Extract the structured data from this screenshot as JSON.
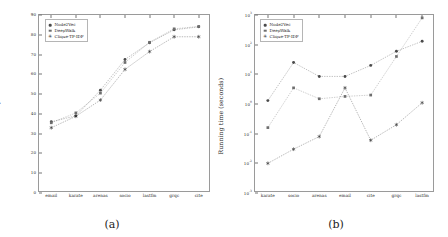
{
  "figure": {
    "panels": [
      {
        "caption": "(a)",
        "ylabel": "Modularity",
        "xlabel": "",
        "legend_position": "top-left"
      },
      {
        "caption": "(b)",
        "ylabel": "Running time (seconds)",
        "xlabel": "",
        "legend_position": "top-left"
      }
    ]
  },
  "legend": {
    "entries": [
      {
        "label": "Node2Vec",
        "color": "#4a4a4a",
        "marker": "circle"
      },
      {
        "label": "DeepWalk",
        "color": "#6e6e6e",
        "marker": "square"
      },
      {
        "label": "Clique-TF-IDF",
        "color": "#2d2d2d",
        "marker": "asterisk"
      }
    ]
  },
  "chart_data": [
    {
      "type": "line",
      "title": "",
      "panel": "(a)",
      "xlabel": "",
      "ylabel": "Modularity",
      "categories": [
        "email",
        "karate",
        "arenas",
        "socio",
        "lastfm",
        "grqc",
        "cite"
      ],
      "ylim": [
        0,
        90
      ],
      "yticks": [
        0,
        10,
        20,
        30,
        40,
        50,
        60,
        70,
        80,
        90
      ],
      "grid": false,
      "legend_position": "upper left",
      "series": [
        {
          "name": "Node2Vec",
          "values": [
            36.0,
            39.0,
            52.0,
            67.5,
            76.0,
            82.5,
            84.0
          ]
        },
        {
          "name": "DeepWalk",
          "values": [
            35.5,
            40.5,
            50.5,
            66.0,
            76.2,
            83.0,
            84.2
          ]
        },
        {
          "name": "Clique-TF-IDF",
          "values": [
            33.0,
            38.8,
            47.0,
            62.5,
            71.5,
            79.0,
            79.0
          ]
        }
      ]
    },
    {
      "type": "line",
      "title": "",
      "panel": "(b)",
      "xlabel": "",
      "ylabel": "Running time (seconds)",
      "categories": [
        "karate",
        "socio",
        "arenas",
        "email",
        "cite",
        "grqc",
        "lastfm"
      ],
      "yscale": "log",
      "ylim": [
        0.001,
        1000
      ],
      "yticks": [
        "10^-3",
        "10^-2",
        "10^-1",
        "10^0",
        "10^1",
        "10^2",
        "10^3"
      ],
      "grid": false,
      "legend_position": "upper left",
      "series": [
        {
          "name": "Node2Vec",
          "values": [
            1.3,
            25.0,
            8.5,
            8.5,
            20.0,
            60.0,
            130.0
          ]
        },
        {
          "name": "DeepWalk",
          "values": [
            0.16,
            3.5,
            1.5,
            1.8,
            2.0,
            40.0,
            800.0
          ]
        },
        {
          "name": "Clique-TF-IDF",
          "values": [
            0.01,
            0.03,
            0.08,
            3.5,
            0.06,
            0.2,
            1.1
          ]
        }
      ]
    }
  ]
}
